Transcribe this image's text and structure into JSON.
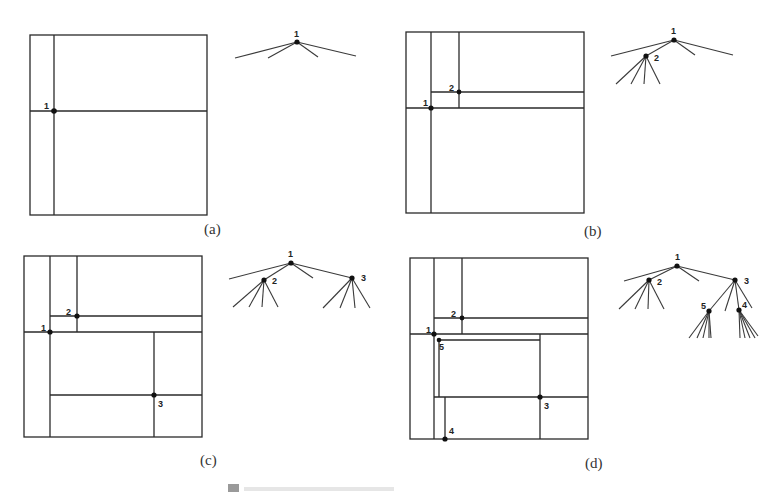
{
  "figure": {
    "caption_faded": "",
    "stroke_color": "#2a2a2a",
    "background": "#ffffff"
  },
  "panels": [
    {
      "label": "(a)",
      "nodes": [
        {
          "id": "1",
          "label": "1"
        }
      ],
      "tree": {
        "root": "1",
        "root_children": 4
      }
    },
    {
      "label": "(b)",
      "nodes": [
        {
          "id": "1",
          "label": "1"
        },
        {
          "id": "2",
          "label": "2"
        }
      ],
      "tree": {
        "root": "1",
        "root_children": 4,
        "node_2_children": 4
      }
    },
    {
      "label": "(c)",
      "nodes": [
        {
          "id": "1",
          "label": "1"
        },
        {
          "id": "2",
          "label": "2"
        },
        {
          "id": "3",
          "label": "3"
        }
      ],
      "tree": {
        "root": "1",
        "root_children": 4,
        "node_2_children": 4,
        "node_3_children": 4
      }
    },
    {
      "label": "(d)",
      "nodes": [
        {
          "id": "1",
          "label": "1"
        },
        {
          "id": "2",
          "label": "2"
        },
        {
          "id": "3",
          "label": "3"
        },
        {
          "id": "4",
          "label": "4"
        },
        {
          "id": "5",
          "label": "5"
        }
      ],
      "tree": {
        "root": "1",
        "root_children": 4,
        "node_2_children": 4,
        "node_3_children": 4,
        "node_5_children": 5,
        "node_4_children": 5
      }
    }
  ]
}
